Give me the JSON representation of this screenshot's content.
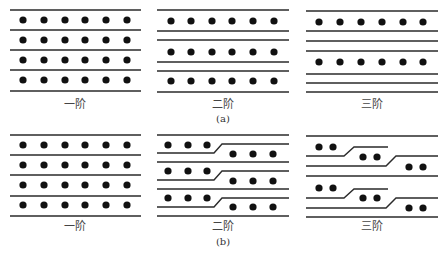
{
  "figure": {
    "part_a": {
      "caption": "(a)",
      "panels": [
        {
          "label": "一阶",
          "rows_of_dots": 4,
          "dots_per_row": 6
        },
        {
          "label": "二阶",
          "rows_of_dots": 3,
          "dots_per_row": 6
        },
        {
          "label": "三阶",
          "rows_of_dots": 2,
          "dots_per_row": 6
        }
      ]
    },
    "part_b": {
      "caption": "(b)",
      "panels": [
        {
          "label": "一阶",
          "rows_of_dots": 4,
          "dots_per_row": 6
        },
        {
          "label": "二阶",
          "rows_of_dots": 3,
          "dots_per_row": 6,
          "staggered": true
        },
        {
          "label": "三阶",
          "rows_of_dots": 2,
          "dots_per_row": 6,
          "staggered": true
        }
      ]
    }
  }
}
